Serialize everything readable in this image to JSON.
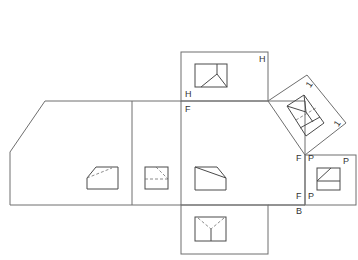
{
  "diagram": {
    "type": "orthographic-projection-folding-lines",
    "labels": {
      "top_box_top_right": "H",
      "top_box_bottom_left": "H",
      "fold_top_left": "F",
      "aux_side_1": "1",
      "aux_side_2": "1",
      "fold_right_top": "F",
      "profile_top_left": "P",
      "profile_top_right": "P",
      "fold_right_bottom": "F",
      "profile_bottom_left": "P",
      "bottom_fold": "B"
    },
    "views": [
      {
        "name": "top-view",
        "plane": "H"
      },
      {
        "name": "auxiliary-view",
        "plane": "1"
      },
      {
        "name": "front-view",
        "plane": "F"
      },
      {
        "name": "profile-view",
        "plane": "P"
      },
      {
        "name": "bottom-view",
        "plane": "B"
      },
      {
        "name": "rear-view"
      },
      {
        "name": "left-side-view"
      }
    ]
  }
}
